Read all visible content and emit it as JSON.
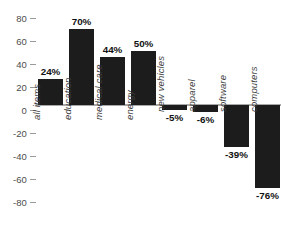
{
  "chart_data": {
    "type": "bar",
    "title": "",
    "subtitle": "",
    "xlabel": "",
    "ylabel": "",
    "ylim": [
      -80,
      80
    ],
    "grid": false,
    "legend": null,
    "orientation": "vertical",
    "bar_color": "#1c1c1c",
    "zero_line_color": "#a8a8a8",
    "axis_text_color": "#4d4d4d",
    "background": "#ffffff",
    "yticks": [
      80,
      60,
      40,
      20,
      0,
      -20,
      -40,
      -60,
      -80
    ],
    "ytick_labels": [
      "80",
      "60",
      "40",
      "20",
      "0",
      "-20",
      "-40",
      "-60",
      "-80"
    ],
    "categories": [
      "all items",
      "education",
      "medical care",
      "energy",
      "new vehicles",
      "apparel",
      "software",
      "computers"
    ],
    "values": [
      24,
      70,
      44,
      50,
      -5,
      -6,
      -39,
      -76
    ],
    "data_labels": [
      "24%",
      "70%",
      "44%",
      "50%",
      "-5%",
      "-6%",
      "-39%",
      "-76%"
    ]
  }
}
